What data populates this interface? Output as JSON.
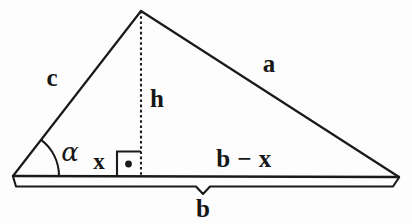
{
  "diagram": {
    "background_color": "#fdfdfd",
    "stroke_color": "#1a1a1a",
    "labels": {
      "side_a": "a",
      "side_c": "c",
      "height_h": "h",
      "segment_x": "x",
      "segment_b_minus_x": "b − x",
      "base_b": "b",
      "angle_alpha": "α"
    },
    "icons": {
      "right_angle_marker": "right-angle-dot-icon",
      "angle_arc": "angle-arc-icon",
      "brace": "measure-brace-icon"
    },
    "geometry": {
      "apex": [
        141,
        11
      ],
      "left_vertex": [
        13,
        176
      ],
      "right_vertex": [
        399,
        177
      ],
      "foot_of_altitude": [
        141,
        176
      ],
      "right_angle_box": [
        117,
        151,
        24,
        25
      ],
      "right_angle_dot": [
        128,
        164
      ],
      "angle_arc_radius": 46,
      "brace_y": 186,
      "brace_notch_x": 203
    }
  }
}
